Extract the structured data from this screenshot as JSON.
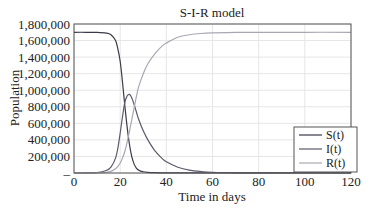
{
  "chart_data": {
    "type": "line",
    "title": "S-I-R model",
    "xlabel": "Time in days",
    "ylabel": "Population",
    "xlim": [
      0,
      120
    ],
    "ylim": [
      0,
      1800000
    ],
    "x_ticks": [
      0,
      20,
      40,
      60,
      80,
      100,
      120
    ],
    "x_tick_labels": [
      "0",
      "20",
      "40",
      "60",
      "80",
      "100",
      "120"
    ],
    "y_ticks": [
      0,
      200000,
      400000,
      600000,
      800000,
      1000000,
      1200000,
      1400000,
      1600000,
      1800000
    ],
    "y_tick_labels": [
      "–",
      "200,000",
      "400,000",
      "600,000",
      "800,000",
      "1,000,000",
      "1,200,000",
      "1,400,000",
      "1,600,000",
      "1,800,000"
    ],
    "grid": true,
    "legend_position": "lower right",
    "x": [
      0,
      5,
      10,
      14,
      16,
      18,
      19,
      20,
      21,
      22,
      23,
      24,
      25,
      26,
      27,
      28,
      30,
      32,
      35,
      38,
      40,
      45,
      50,
      55,
      60,
      70,
      80,
      100,
      120
    ],
    "series": [
      {
        "name": "S(t)",
        "color": "#3a3a4a",
        "values": [
          1700000,
          1700000,
          1698000,
          1690000,
          1670000,
          1600000,
          1500000,
          1350000,
          1100000,
          820000,
          560000,
          350000,
          200000,
          110000,
          60000,
          35000,
          15000,
          8000,
          4000,
          2500,
          2000,
          1500,
          1200,
          1000,
          1000,
          1000,
          1000,
          1000,
          1000
        ]
      },
      {
        "name": "I(t)",
        "color": "#5a5a6a",
        "values": [
          0,
          500,
          5000,
          30000,
          70000,
          180000,
          300000,
          480000,
          680000,
          850000,
          930000,
          950000,
          910000,
          830000,
          740000,
          650000,
          510000,
          400000,
          270000,
          180000,
          135000,
          70000,
          35000,
          18000,
          9000,
          2500,
          700,
          50,
          0
        ]
      },
      {
        "name": "R(t)",
        "color": "#a8a8b4",
        "values": [
          0,
          0,
          1000,
          8000,
          20000,
          50000,
          80000,
          120000,
          180000,
          260000,
          370000,
          500000,
          640000,
          780000,
          920000,
          1040000,
          1200000,
          1320000,
          1440000,
          1530000,
          1570000,
          1640000,
          1670000,
          1685000,
          1692000,
          1698000,
          1699000,
          1700000,
          1700000
        ]
      }
    ]
  }
}
